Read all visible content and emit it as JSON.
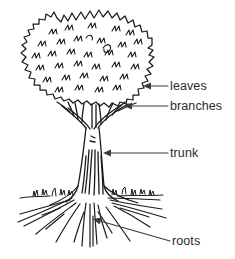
{
  "diagram": {
    "style": "black-and-white line drawing",
    "background_color": "#ffffff",
    "ink_color": "#1a1a1a",
    "text_color": "#2b2b2b",
    "labels": [
      {
        "id": "leaves",
        "text": "leaves",
        "arrow": "leader-line-with-arrowhead",
        "points_to": "canopy-foliage"
      },
      {
        "id": "branches",
        "text": "branches",
        "arrow": "leader-line-with-arrowhead",
        "points_to": "branch-fork"
      },
      {
        "id": "trunk",
        "text": "trunk",
        "arrow": "leader-line-with-arrowhead",
        "points_to": "trunk-column"
      },
      {
        "id": "roots",
        "text": "roots",
        "arrow": "leader-line-with-arrowhead",
        "points_to": "root-system"
      }
    ],
    "parts": [
      {
        "id": "canopy",
        "name": "canopy"
      },
      {
        "id": "branches",
        "name": "branches"
      },
      {
        "id": "trunk",
        "name": "trunk"
      },
      {
        "id": "ground",
        "name": "ground line with grass"
      },
      {
        "id": "roots",
        "name": "roots"
      }
    ]
  }
}
